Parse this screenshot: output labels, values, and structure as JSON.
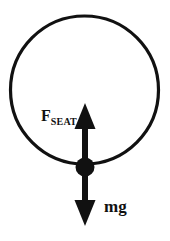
{
  "figure": {
    "kind": "free-body-diagram",
    "background_color": "#ffffff",
    "stroke_color": "#111111",
    "circle": {
      "name": "vertical-circular-path",
      "center_x": 84.5,
      "center_y": 90,
      "radius": 74,
      "stroke_width": 3.2,
      "fill": "none"
    },
    "mass_point": {
      "name": "point-mass",
      "center_x": 85,
      "center_y": 167,
      "radius": 9.5,
      "fill": "#111111"
    },
    "arrows": [
      {
        "id": "f-seat",
        "direction": "up",
        "tail_x": 85,
        "tail_y": 167,
        "tip_x": 85,
        "tip_y": 103,
        "shaft_width": 6,
        "head_width": 21,
        "head_length": 26,
        "color": "#111111"
      },
      {
        "id": "mg",
        "direction": "down",
        "tail_x": 85,
        "tail_y": 167,
        "tip_x": 85,
        "tip_y": 226,
        "shaft_width": 6,
        "head_width": 21,
        "head_length": 26,
        "color": "#111111"
      }
    ],
    "labels": {
      "f_seat": {
        "base": "F",
        "subscript": "SEAT"
      },
      "mg": "mg"
    }
  }
}
